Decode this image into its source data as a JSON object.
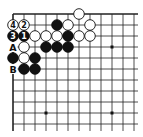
{
  "board": {
    "origin_x": 13,
    "origin_y": 14,
    "spacing": 11,
    "cols": 12,
    "rows": 11,
    "extend_right": 4,
    "extend_bottom": 7,
    "line_color": "#222222",
    "star_points": [
      [
        3,
        3
      ],
      [
        9,
        3
      ],
      [
        3,
        9
      ],
      [
        9,
        9
      ]
    ],
    "stones": [
      {
        "color": "white",
        "col": 6,
        "row": 0,
        "label": ""
      },
      {
        "color": "white",
        "col": 0,
        "row": 1,
        "label": "4"
      },
      {
        "color": "white",
        "col": 1,
        "row": 1,
        "label": "2"
      },
      {
        "color": "black",
        "col": 4,
        "row": 1,
        "label": ""
      },
      {
        "color": "white",
        "col": 5,
        "row": 1,
        "label": ""
      },
      {
        "color": "white",
        "col": 7,
        "row": 1,
        "label": ""
      },
      {
        "color": "black",
        "col": 0,
        "row": 2,
        "label": "3"
      },
      {
        "color": "black",
        "col": 1,
        "row": 2,
        "label": "1"
      },
      {
        "color": "white",
        "col": 2,
        "row": 2,
        "label": ""
      },
      {
        "color": "white",
        "col": 3,
        "row": 2,
        "label": ""
      },
      {
        "color": "white",
        "col": 4,
        "row": 2,
        "label": ""
      },
      {
        "color": "black",
        "col": 5,
        "row": 2,
        "label": ""
      },
      {
        "color": "white",
        "col": 6,
        "row": 2,
        "label": ""
      },
      {
        "color": "white",
        "col": 7,
        "row": 2,
        "label": ""
      },
      {
        "color": "white",
        "col": 1,
        "row": 3,
        "label": ""
      },
      {
        "color": "black",
        "col": 3,
        "row": 3,
        "label": ""
      },
      {
        "color": "black",
        "col": 4,
        "row": 3,
        "label": ""
      },
      {
        "color": "black",
        "col": 5,
        "row": 3,
        "label": ""
      },
      {
        "color": "black",
        "col": 0,
        "row": 4,
        "label": ""
      },
      {
        "color": "white",
        "col": 1,
        "row": 4,
        "label": ""
      },
      {
        "color": "black",
        "col": 2,
        "row": 4,
        "label": ""
      },
      {
        "color": "black",
        "col": 1,
        "row": 5,
        "label": ""
      },
      {
        "color": "black",
        "col": 2,
        "row": 5,
        "label": ""
      }
    ],
    "point_labels": [
      {
        "col": 0,
        "row": 3,
        "text": "A"
      },
      {
        "col": 0,
        "row": 5,
        "text": "B"
      }
    ]
  }
}
